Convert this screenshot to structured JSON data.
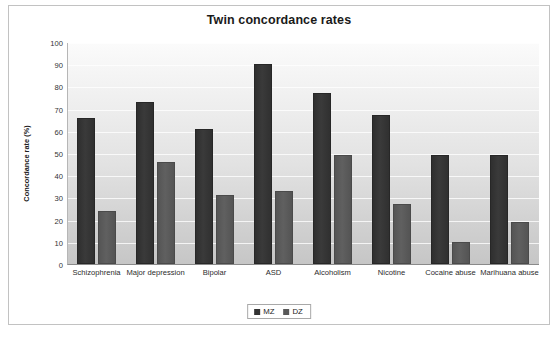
{
  "chart_data": {
    "type": "bar",
    "title": "Twin concordance rates",
    "xlabel": "",
    "ylabel": "Concordance rate (%)",
    "ylim": [
      0,
      100
    ],
    "ytick_step": 10,
    "yticks": [
      "100",
      "90",
      "80",
      "70",
      "60",
      "50",
      "40",
      "30",
      "20",
      "10",
      "0"
    ],
    "grid": true,
    "legend_position": "bottom",
    "categories": [
      "Schizophrenia",
      "Major depression",
      "Bipolar",
      "ASD",
      "Alcoholism",
      "Nicotine",
      "Cocaine abuse",
      "Marihuana abuse"
    ],
    "series": [
      {
        "name": "MZ",
        "color": "#333333",
        "values": [
          65,
          72,
          60,
          89,
          76,
          66,
          48,
          48
        ]
      },
      {
        "name": "DZ",
        "color": "#595959",
        "values": [
          23,
          45,
          30,
          32,
          48,
          26,
          9,
          18
        ]
      }
    ]
  },
  "legend": {
    "items": [
      {
        "label": "MZ"
      },
      {
        "label": "DZ"
      }
    ]
  }
}
